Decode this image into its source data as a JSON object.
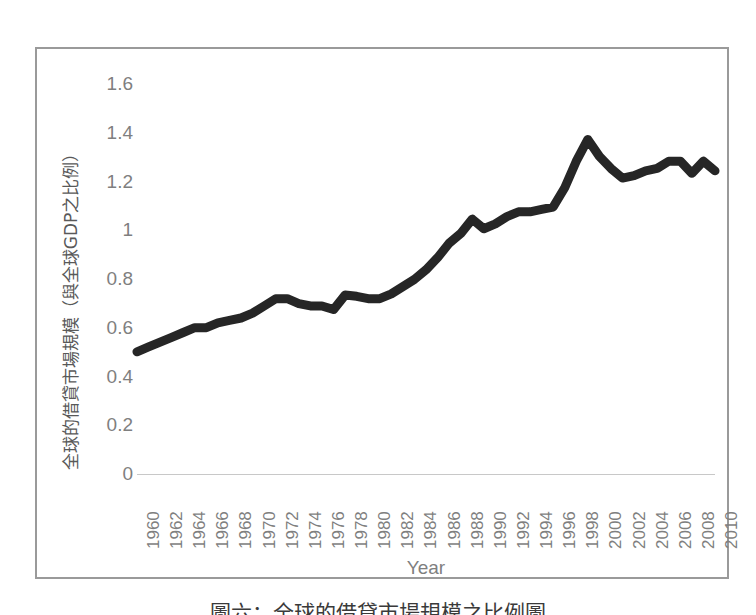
{
  "figure": {
    "caption": "圖六：全球的借貸市場規模之比例圖"
  },
  "chart_data": {
    "type": "line",
    "title": "",
    "xlabel": "Year",
    "ylabel": "全球的借貸市場規模（與全球GDP之比例）",
    "xlim": [
      1960,
      2010
    ],
    "ylim": [
      0,
      1.6
    ],
    "ytick_step": 0.2,
    "ytick_labels": [
      "1.6",
      "1.4",
      "1.2",
      "1",
      "0.8",
      "0.6",
      "0.4",
      "0.2",
      "0"
    ],
    "ytick_values": [
      1.6,
      1.4,
      1.2,
      1.0,
      0.8,
      0.6,
      0.4,
      0.2,
      0
    ],
    "xtick_labels": [
      "1960",
      "1962",
      "1964",
      "1966",
      "1968",
      "1970",
      "1972",
      "1974",
      "1976",
      "1978",
      "1980",
      "1982",
      "1984",
      "1986",
      "1988",
      "1990",
      "1992",
      "1994",
      "1996",
      "1998",
      "2000",
      "2002",
      "2004",
      "2006",
      "2008",
      "2010"
    ],
    "xtick_values": [
      1960,
      1962,
      1964,
      1966,
      1968,
      1970,
      1972,
      1974,
      1976,
      1978,
      1980,
      1982,
      1984,
      1986,
      1988,
      1990,
      1992,
      1994,
      1996,
      1998,
      2000,
      2002,
      2004,
      2006,
      2008,
      2010
    ],
    "grid": false,
    "legend": false,
    "line_color": "#262626",
    "line_width": 4,
    "series": [
      {
        "name": "全球的借貸市場規模（與全球GDP之比例）",
        "x": [
          1960,
          1961,
          1962,
          1963,
          1964,
          1965,
          1966,
          1967,
          1968,
          1969,
          1970,
          1971,
          1972,
          1973,
          1974,
          1975,
          1976,
          1977,
          1978,
          1979,
          1980,
          1981,
          1982,
          1983,
          1984,
          1985,
          1986,
          1987,
          1988,
          1989,
          1990,
          1991,
          1992,
          1993,
          1994,
          1995,
          1996,
          1997,
          1998,
          1999,
          2000,
          2001,
          2002,
          2003,
          2004,
          2005,
          2006,
          2007,
          2008,
          2009,
          2010
        ],
        "values": [
          0.49,
          0.51,
          0.53,
          0.55,
          0.57,
          0.59,
          0.59,
          0.61,
          0.62,
          0.63,
          0.65,
          0.68,
          0.71,
          0.71,
          0.69,
          0.68,
          0.68,
          0.665,
          0.725,
          0.72,
          0.71,
          0.71,
          0.73,
          0.76,
          0.79,
          0.83,
          0.88,
          0.94,
          0.98,
          1.04,
          1.0,
          1.02,
          1.05,
          1.07,
          1.07,
          1.08,
          1.09,
          1.17,
          1.28,
          1.37,
          1.3,
          1.25,
          1.21,
          1.22,
          1.24,
          1.25,
          1.28,
          1.28,
          1.23,
          1.28,
          1.24
        ]
      }
    ]
  }
}
